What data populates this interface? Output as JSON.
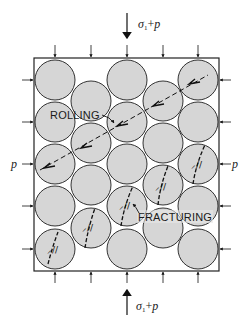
{
  "diagram": {
    "colors": {
      "grain_fill": "#d6d6d6",
      "grain_stroke": "#333333",
      "frame_stroke": "#222222",
      "line": "#111111"
    },
    "labels": {
      "rolling": "ROLLING",
      "fracturing": "FRACTURING",
      "top_load_symbol": "σ",
      "top_load_sub": "1",
      "top_load_rest": "+",
      "top_load_p": "p",
      "bottom_load_symbol": "σ",
      "bottom_load_sub": "1",
      "bottom_load_rest": "+",
      "bottom_load_p": "p",
      "left_pressure": "p",
      "right_pressure": "p"
    },
    "grains": {
      "rows_main_columns": 5,
      "rows_offset_columns": 4,
      "main_columns": 3,
      "offset_columns": 2
    },
    "features": {
      "rolling_shear_band": "dashed diagonal line from lower-left to upper-right with rotation arrows",
      "fracture_count": 5
    }
  }
}
